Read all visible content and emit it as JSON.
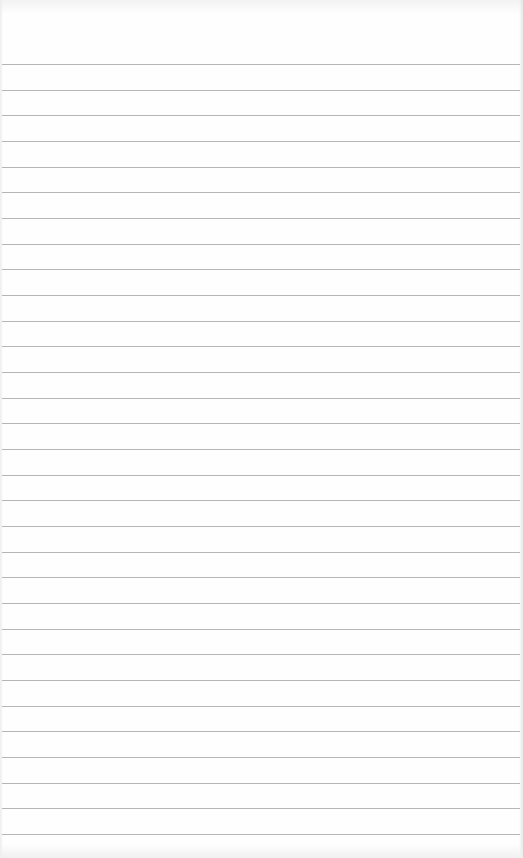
{
  "page": {
    "type": "ruled-notebook-paper",
    "title": "",
    "background_color": "#fefefe",
    "line_color": "#a9a9a9",
    "line_count": 31,
    "first_line_y": 64,
    "line_spacing": 25.67,
    "lines": []
  }
}
